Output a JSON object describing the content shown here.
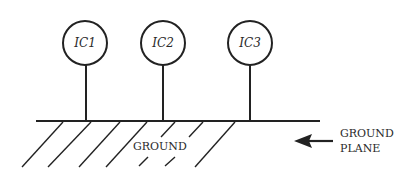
{
  "diagram": {
    "title": "",
    "components": [
      {
        "label": "IC1",
        "cx": 85,
        "cy": 43
      },
      {
        "label": "IC2",
        "cx": 163,
        "cy": 43
      },
      {
        "label": "IC3",
        "cx": 250,
        "cy": 43
      }
    ],
    "ground_label": "GROUND",
    "ground_plane_label_line1": "GROUND",
    "ground_plane_label_line2": "PLANE",
    "colors": {
      "stroke": "#222222",
      "background": "#ffffff"
    }
  }
}
